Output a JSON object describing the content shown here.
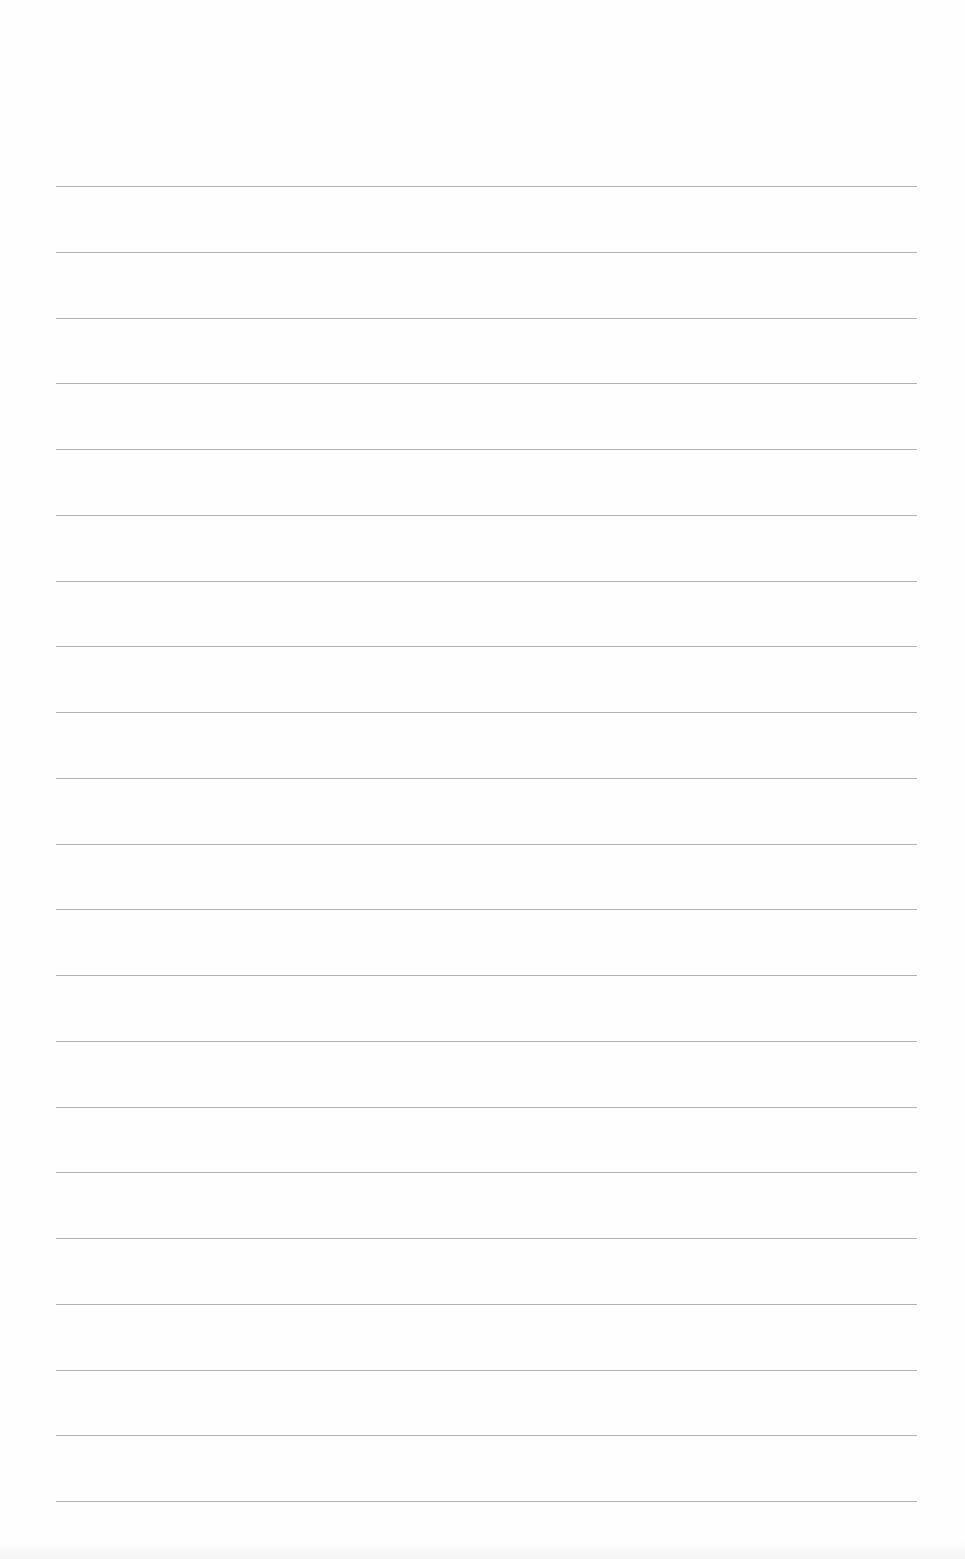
{
  "page": {
    "type": "lined-paper",
    "background_color": "#fefefe",
    "rule_color": "#9a9a9a",
    "rule_count": 21,
    "rule_left": 56,
    "rule_right": 917,
    "first_rule_y": 186,
    "rule_spacing": 65.75
  }
}
